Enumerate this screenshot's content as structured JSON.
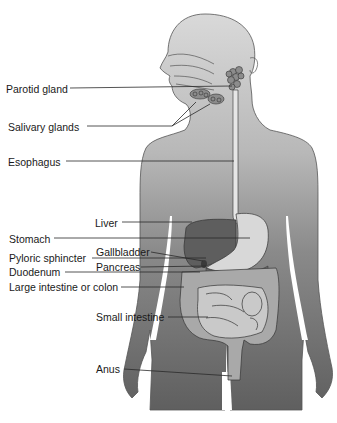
{
  "diagram": {
    "colors": {
      "background": "#ffffff",
      "body_light": "#cfcfcf",
      "body_dark": "#6a6a6a",
      "liver": "#5e5e5e",
      "stomach": "#d8d8d8",
      "intestine_large": "#a9a9a9",
      "intestine_small": "#c9c9c9",
      "outline": "#3a3a3a",
      "leader_line": "#2a2a2a",
      "label_text": "#1a1a1a"
    },
    "labels": [
      {
        "id": "parotid_gland",
        "text": "Parotid gland",
        "x": 6,
        "y": 83
      },
      {
        "id": "salivary_glands",
        "text": "Salivary glands",
        "x": 8,
        "y": 121
      },
      {
        "id": "esophagus",
        "text": "Esophagus",
        "x": 8,
        "y": 156
      },
      {
        "id": "liver",
        "text": "Liver",
        "x": 95,
        "y": 217
      },
      {
        "id": "stomach",
        "text": "Stomach",
        "x": 9,
        "y": 233
      },
      {
        "id": "gallbladder",
        "text": "Gallbladder",
        "x": 96,
        "y": 247
      },
      {
        "id": "pyloric_sphincter",
        "text": "Pyloric sphincter",
        "x": 9,
        "y": 252
      },
      {
        "id": "pancreas",
        "text": "Pancreas",
        "x": 96,
        "y": 261
      },
      {
        "id": "duodenum",
        "text": "Duodenum",
        "x": 9,
        "y": 266
      },
      {
        "id": "large_intestine",
        "text": "Large intestine or colon",
        "x": 9,
        "y": 281
      },
      {
        "id": "small_intestine",
        "text": "Small intestine",
        "x": 96,
        "y": 311
      },
      {
        "id": "anus",
        "text": "Anus",
        "x": 96,
        "y": 363
      }
    ]
  }
}
